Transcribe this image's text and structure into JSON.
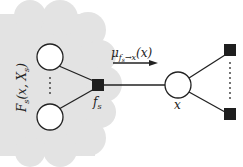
{
  "diagram": {
    "type": "factor-graph",
    "cloud_label": "F_s(x, X_s)",
    "cloud_label_main": "F",
    "cloud_label_sub": "s",
    "cloud_label_args": "(x, X",
    "cloud_label_args_sub": "s",
    "cloud_label_close": ")",
    "factor_label_main": "f",
    "factor_label_sub": "s",
    "variable_label": "x",
    "message_label_mu": "μ",
    "message_label_sub": "f",
    "message_label_subsub": "s",
    "message_label_arrow": "→x",
    "message_label_arg": "(x)",
    "colors": {
      "cloud": "#e3e3e3",
      "line": "#222222",
      "factor_fill": "#1e1e1e",
      "node_fill": "#ffffff"
    },
    "nodes": [
      {
        "id": "var-top",
        "kind": "variable"
      },
      {
        "id": "var-bottom",
        "kind": "variable"
      },
      {
        "id": "factor-fs",
        "kind": "factor"
      },
      {
        "id": "var-x",
        "kind": "variable"
      },
      {
        "id": "factor-right-top",
        "kind": "factor"
      },
      {
        "id": "factor-right-bottom",
        "kind": "factor"
      }
    ]
  }
}
